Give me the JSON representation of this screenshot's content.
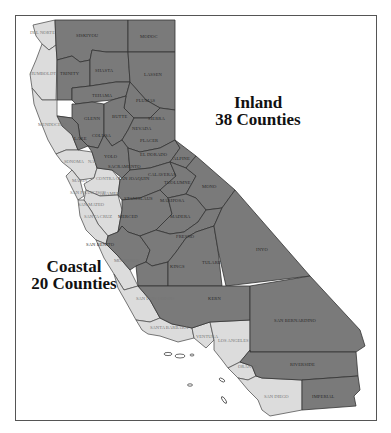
{
  "map": {
    "title_partial": "",
    "region_labels": {
      "inland": {
        "name": "Inland",
        "count_text": "38 Counties",
        "color": "#7a7a7a"
      },
      "coastal": {
        "name": "Coastal",
        "count_text": "20 Counties",
        "color": "#dcdcdc"
      }
    },
    "inland_counties": [
      "SISKIYOU",
      "MODOC",
      "TRINITY",
      "SHASTA",
      "LASSEN",
      "TEHAMA",
      "PLUMAS",
      "GLENN",
      "BUTTE",
      "SIERRA",
      "LAKE",
      "COLUSA",
      "SUTTER",
      "YUBA",
      "NEVADA",
      "PLACER",
      "YOLO",
      "EL DORADO",
      "SACRAMENTO",
      "AMADOR",
      "ALPINE",
      "SAN JOAQUIN",
      "CALAVERAS",
      "TUOLUMNE",
      "MONO",
      "STANISLAUS",
      "MARIPOSA",
      "MERCED",
      "MADERA",
      "SAN BENITO",
      "FRESNO",
      "KINGS",
      "TULARE",
      "INYO",
      "KERN",
      "SAN BERNARDINO",
      "RIVERSIDE",
      "IMPERIAL"
    ],
    "coastal_counties": [
      "DEL NORTE",
      "HUMBOLDT",
      "MENDOCINO",
      "SONOMA",
      "NAPA",
      "MARIN",
      "SOLANO",
      "CONTRA COSTA",
      "SAN FRANCISCO",
      "ALAMEDA",
      "SAN MATEO",
      "SANTA CLARA",
      "SANTA CRUZ",
      "MONTEREY",
      "SAN LUIS OBISPO",
      "SANTA BARBARA",
      "VENTURA",
      "LOS ANGELES",
      "ORANGE",
      "SAN DIEGO"
    ],
    "labels": {
      "del_norte": "DEL NORTE",
      "siskiyou": "SISKIYOU",
      "modoc": "MODOC",
      "humboldt": "HUMBOLDT",
      "trinity": "TRINITY",
      "shasta": "SHASTA",
      "lassen": "LASSEN",
      "tehama": "TEHAMA",
      "plumas": "PLUMAS",
      "mendocino": "MENDOCINO",
      "glenn": "GLENN",
      "butte": "BUTTE",
      "sierra": "SIERRA",
      "lake": "LAKE",
      "colusa": "COLUSA",
      "nevada": "NEVADA",
      "placer": "PLACER",
      "yolo": "YOLO",
      "sonoma": "SONOMA",
      "napa": "NAP",
      "el_dorado": "EL DORADO",
      "alpine": "ALPINE",
      "sacramento": "SACRAMENTO",
      "marin": "MARIN",
      "contra_costa": "CONTRA COSTA",
      "san_joaquin": "SAN JOAQUIN",
      "calaveras": "CALAVERAS",
      "tuolumne": "TUOLUMNE",
      "mono": "MONO",
      "san_francisco": "SAN FRANCISCO",
      "alameda": "ALAMEDA",
      "san_mateo": "SAN MATEO",
      "stanislaus": "STANISLAUS",
      "mariposa": "MARIPOSA",
      "santa_cruz": "SANTA CRUZ",
      "merced": "MERCED",
      "madera": "MADERA",
      "santa_clara": "SANTA CLARA",
      "san_benito": "SAN BENITO",
      "fresno": "FRESNO",
      "monterey": "MONTEREY",
      "kings": "KINGS",
      "tulare": "TULARE",
      "inyo": "INYO",
      "san_luis_obispo": "SAN LUIS OBISPO",
      "kern": "KERN",
      "san_bernardino": "SAN BERNARDINO",
      "santa_barbara": "SANTA BARBARA",
      "ventura": "VENTURA",
      "los_angeles": "LOS ANGELES",
      "orange": "ORANGE",
      "riverside": "RIVERSIDE",
      "san_diego": "SAN DIEGO",
      "imperial": "IMPERIAL"
    }
  }
}
